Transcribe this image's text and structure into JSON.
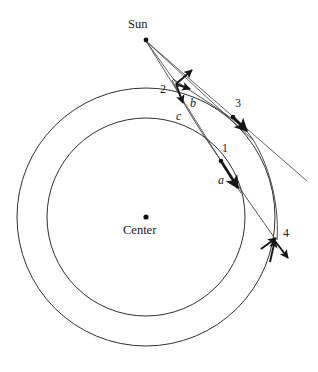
{
  "figure": {
    "type": "orbital-mechanics-diagram",
    "background_color": "#ffffff",
    "stroke_color": "#2a2a2a",
    "text_color": "#1a1a1a",
    "width": 318,
    "height": 372
  },
  "labels": {
    "sun": "Sun",
    "center": "Center",
    "point_1": "1",
    "point_2": "2",
    "point_3": "3",
    "point_4": "4",
    "vector_a": "a",
    "vector_b": "b",
    "vector_c": "c"
  },
  "geometry": {
    "center_point": {
      "x": 146,
      "y": 217
    },
    "sun_point": {
      "x": 146,
      "y": 40
    },
    "outer_circle": {
      "cx": 146,
      "cy": 217,
      "r": 129
    },
    "inner_circle": {
      "cx": 146,
      "cy": 217,
      "r": 99
    },
    "markers": [
      {
        "name": "point-1",
        "x": 221,
        "y": 161
      },
      {
        "name": "point-2",
        "x": 176,
        "y": 84
      },
      {
        "name": "point-3",
        "x": 233,
        "y": 117
      },
      {
        "name": "point-4",
        "x": 277,
        "y": 241
      }
    ],
    "label_positions": {
      "sun": {
        "x": 128,
        "y": 18
      },
      "center": {
        "x": 123,
        "y": 224
      },
      "point_1": {
        "x": 222,
        "y": 142
      },
      "point_2": {
        "x": 160,
        "y": 83
      },
      "point_3": {
        "x": 235,
        "y": 97
      },
      "point_4": {
        "x": 283,
        "y": 227
      },
      "vector_a": {
        "x": 218,
        "y": 174
      },
      "vector_b": {
        "x": 190,
        "y": 97
      },
      "vector_c": {
        "x": 176,
        "y": 110
      }
    }
  }
}
